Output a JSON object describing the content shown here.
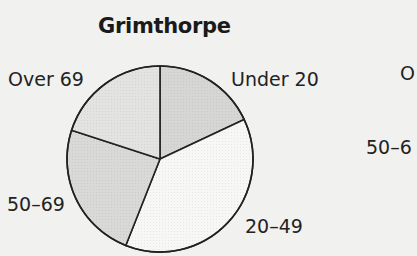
{
  "chart_data": {
    "type": "pie",
    "title": "Grimthorpe",
    "categories": [
      "Under 20",
      "20–49",
      "50–69",
      "Over 69"
    ],
    "values": [
      18,
      38,
      24,
      20
    ],
    "unit": "percent (estimated from slice angles)",
    "start_angle_deg": 0,
    "direction": "clockwise",
    "colors": [
      "#d6d6d4",
      "#f7f7f6",
      "#d9d9d8",
      "#e3e3e2"
    ],
    "legend": "none (direct labels)",
    "partial_second_chart_labels": [
      "O",
      "50–6"
    ]
  },
  "labels": {
    "title": "Grimthorpe",
    "under20": "Under 20",
    "age20_49": "20–49",
    "age50_69": "50–69",
    "over69": "Over 69",
    "clipped_right_top": "O",
    "clipped_right_mid": "50–6"
  }
}
